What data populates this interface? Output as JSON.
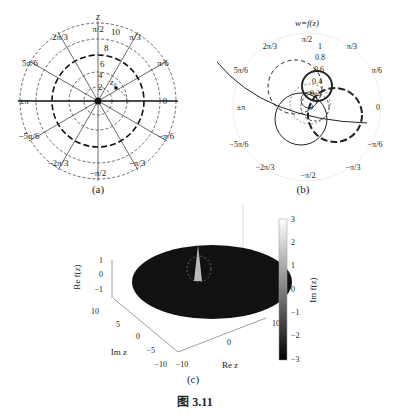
{
  "figure": {
    "title": "图 3.11",
    "panels": [
      {
        "id": "a",
        "caption": "(a)",
        "plot_title": "z",
        "type": "polar-grid",
        "radial_ticks": [
          "2",
          "4",
          "6",
          "8",
          "10"
        ],
        "angle_labels": [
          "0",
          "π/6",
          "π/3",
          "π/2",
          "2π/3",
          "5π/6",
          "±π",
          "−5π/6",
          "−2π/3",
          "−π/2",
          "−π/3",
          "−π/6"
        ],
        "annotation": "z₀"
      },
      {
        "id": "b",
        "caption": "(b)",
        "plot_title": "w=f(z)",
        "type": "polar-image",
        "radial_ticks": [
          "0",
          "0.2",
          "0.4",
          "0.6",
          "0.8",
          "1"
        ],
        "angle_labels": [
          "0",
          "π/6",
          "π/3",
          "π/2",
          "2π/3",
          "5π/6",
          "±π",
          "−5π/6",
          "−2π/3",
          "−π/2",
          "−π/3",
          "−π/6"
        ]
      },
      {
        "id": "c",
        "caption": "(c)",
        "type": "3d-surface",
        "zlabel": "Re f(z)",
        "zticks": [
          "1",
          "0",
          "−1"
        ],
        "ylabel": "Im z",
        "yticks": [
          "10",
          "5",
          "0",
          "−5",
          "−10"
        ],
        "xlabel": "Re z",
        "xticks": [
          "−10",
          "0",
          "10"
        ],
        "colorbar": {
          "label": "Im f(z)",
          "ticks": [
            "3",
            "2",
            "1",
            "0",
            "−1",
            "−2",
            "−3"
          ]
        }
      }
    ]
  }
}
